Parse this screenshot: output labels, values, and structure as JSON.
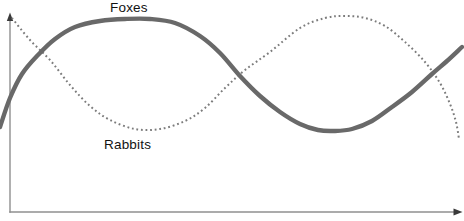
{
  "figure": {
    "background": "#ffffff",
    "labels": {
      "foxes": "Foxes",
      "rabbits": "Rabbits"
    },
    "colors": {
      "foxes_curve": "#696969",
      "rabbits_curve": "#7c7c7c",
      "axis": "#8f8f8f",
      "arrow": "#3a3a3a",
      "label_text": "#121212"
    }
  },
  "chart_data": {
    "type": "line",
    "title": "",
    "xlabel": "",
    "ylabel": "",
    "grid": false,
    "axis_ticks": "none",
    "legend": "inline-labels",
    "series": [
      {
        "name": "Foxes",
        "label": "Foxes",
        "style": "solid",
        "color": "#696969",
        "stroke_width": 4.4,
        "dasharray": "",
        "points_px": [
          [
            0,
            127
          ],
          [
            10,
            98
          ],
          [
            22,
            74
          ],
          [
            38,
            55
          ],
          [
            55,
            39
          ],
          [
            75,
            27
          ],
          [
            100,
            21
          ],
          [
            125,
            19
          ],
          [
            150,
            19
          ],
          [
            175,
            23
          ],
          [
            200,
            36
          ],
          [
            220,
            53
          ],
          [
            240,
            76
          ],
          [
            260,
            96
          ],
          [
            280,
            112
          ],
          [
            300,
            124
          ],
          [
            318,
            130
          ],
          [
            334,
            131
          ],
          [
            352,
            129
          ],
          [
            372,
            121
          ],
          [
            392,
            107
          ],
          [
            412,
            92
          ],
          [
            432,
            74
          ],
          [
            447,
            61
          ],
          [
            462,
            47
          ]
        ]
      },
      {
        "name": "Rabbits",
        "label": "Rabbits",
        "style": "dotted",
        "color": "#7c7c7c",
        "stroke_width": 2,
        "dasharray": "1.8 2.8",
        "points_px": [
          [
            12,
            18
          ],
          [
            30,
            40
          ],
          [
            50,
            60
          ],
          [
            70,
            85
          ],
          [
            90,
            106
          ],
          [
            110,
            120
          ],
          [
            135,
            129
          ],
          [
            160,
            129
          ],
          [
            185,
            121
          ],
          [
            205,
            108
          ],
          [
            225,
            88
          ],
          [
            245,
            70
          ],
          [
            270,
            52
          ],
          [
            300,
            28
          ],
          [
            325,
            18
          ],
          [
            345,
            16
          ],
          [
            365,
            18
          ],
          [
            385,
            26
          ],
          [
            405,
            42
          ],
          [
            425,
            62
          ],
          [
            440,
            83
          ],
          [
            450,
            104
          ],
          [
            456,
            122
          ],
          [
            459,
            139
          ]
        ]
      }
    ]
  }
}
